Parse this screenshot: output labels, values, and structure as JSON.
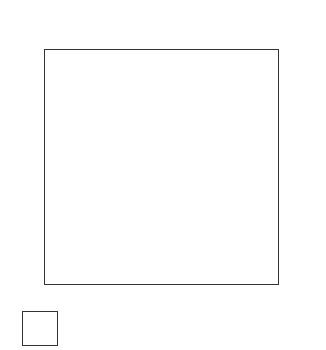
{
  "chart_data": {
    "type": "scatter",
    "xlabel": "x1",
    "ylabel": "x2",
    "x_ticks": [
      "0.5",
      "1.0",
      "1.5",
      "2.0",
      "2.5"
    ],
    "y_ticks": [
      "-0.5",
      "0.0",
      "0.5",
      "1.0",
      "1.5",
      "2.0",
      "2.5"
    ],
    "xlim": [
      0.25,
      2.95
    ],
    "ylim": [
      -0.75,
      2.75
    ],
    "grid_columns": 6,
    "grid_rows": 6,
    "top_strip_label": "x4",
    "right_strip_label": "x3",
    "thumbnail": {
      "xlabel": "x1",
      "ylabel": "x2"
    },
    "panel_density": [
      [
        2,
        4,
        4,
        0,
        0,
        0
      ],
      [
        16,
        8,
        3,
        3,
        2,
        2
      ],
      [
        22,
        3,
        5,
        6,
        5,
        4
      ],
      [
        10,
        5,
        3,
        8,
        12,
        14
      ],
      [
        4,
        1,
        2,
        10,
        22,
        14
      ],
      [
        0,
        3,
        8,
        16,
        22,
        4
      ]
    ]
  },
  "labels": {
    "x4": "x",
    "x4_sub": "4",
    "x2": "x",
    "x2_sub": "2",
    "x1_corner": "x",
    "x1_corner_sub": "1",
    "x1_axis": "x",
    "x1_axis_sub": "1",
    "x3": "x",
    "x3_sub": "3",
    "thumb_x2": "x",
    "thumb_x2_sub": "2",
    "exhibit": "Exhibit 18"
  }
}
